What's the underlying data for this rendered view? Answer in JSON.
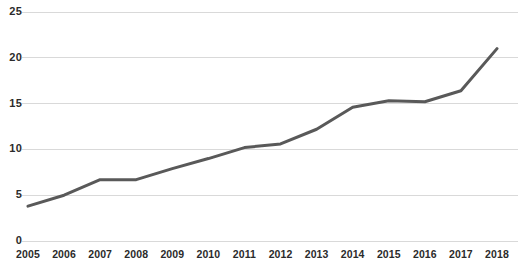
{
  "chart_data": {
    "type": "line",
    "title": "",
    "subtitle": "",
    "xlabel": "",
    "ylabel": "",
    "categories": [
      "2005",
      "2006",
      "2007",
      "2008",
      "2009",
      "2010",
      "2011",
      "2012",
      "2013",
      "2014",
      "2015",
      "2016",
      "2017",
      "2018"
    ],
    "values": [
      3.8,
      5.0,
      6.7,
      6.7,
      7.9,
      9.0,
      10.2,
      10.6,
      12.2,
      14.6,
      15.3,
      15.2,
      16.4,
      21.0
    ],
    "series": [
      {
        "name": "",
        "values": [
          3.8,
          5.0,
          6.7,
          6.7,
          7.9,
          9.0,
          10.2,
          10.6,
          12.2,
          14.6,
          15.3,
          15.2,
          16.4,
          21.0
        ]
      }
    ],
    "ylim": [
      0,
      25
    ],
    "yticks": [
      0,
      5,
      10,
      15,
      20,
      25
    ],
    "ytick_labels": [
      "0",
      "5",
      "10",
      "15",
      "20",
      "25"
    ],
    "xtick_labels": [
      "2005",
      "2006",
      "2007",
      "2008",
      "2009",
      "2010",
      "2011",
      "2012",
      "2013",
      "2014",
      "2015",
      "2016",
      "2017",
      "2018"
    ],
    "grid": "horizontal",
    "legend": "none",
    "line_color": "#595959",
    "gridline_color": "#d9d9d9",
    "axis_text_color": "#2b2b2b",
    "background_color": "#ffffff",
    "line_width": 3,
    "markers": false,
    "annotations": []
  }
}
